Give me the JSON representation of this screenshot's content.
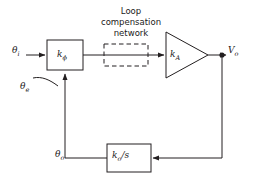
{
  "figure": {
    "type": "block-diagram",
    "background_color": "#ffffff",
    "line_color": "#231f20"
  },
  "caption": {
    "loop_compensation": "Loop\ncompensation\nnetwork"
  },
  "signals": {
    "input": "θi",
    "input_plain": "theta_i",
    "error": "θe",
    "error_plain": "theta_e",
    "feedback": "θo",
    "feedback_plain": "theta_o",
    "output": "Vo",
    "output_plain": "V_o"
  },
  "blocks": [
    {
      "id": "phase-detector",
      "label": "kφ",
      "label_base": "k",
      "label_sub": "φ",
      "shape": "rectangle",
      "x": 47,
      "y": 40,
      "width": 36,
      "height": 30
    },
    {
      "id": "loop-compensation",
      "label": "",
      "shape": "dashed-rectangle",
      "x": 104,
      "y": 44,
      "width": 44,
      "height": 22
    },
    {
      "id": "amplifier",
      "label": "kA",
      "label_base": "k",
      "label_sub": "A",
      "shape": "triangle",
      "x": 164,
      "y": 32,
      "width": 44,
      "height": 46
    },
    {
      "id": "vco-integrator",
      "label": "ko/s",
      "label_base": "k",
      "label_sub": "o",
      "label_tail": "/s",
      "shape": "rectangle",
      "x": 107,
      "y": 144,
      "width": 44,
      "height": 28
    }
  ],
  "nodes": [
    {
      "id": "output-tap",
      "x": 222,
      "y": 55,
      "type": "junction-dot"
    }
  ],
  "connections": [
    {
      "from": "input",
      "to": "phase-detector",
      "arrow": true
    },
    {
      "from": "phase-detector",
      "to": "loop-compensation",
      "arrow": false
    },
    {
      "from": "loop-compensation",
      "to": "amplifier",
      "arrow": true
    },
    {
      "from": "amplifier",
      "to": "output-tap",
      "arrow": false
    },
    {
      "from": "output-tap",
      "to": "output",
      "arrow": true
    },
    {
      "from": "output-tap",
      "to": "vco-integrator",
      "arrow": true
    },
    {
      "from": "vco-integrator",
      "to": "phase-detector",
      "arrow": true
    }
  ]
}
